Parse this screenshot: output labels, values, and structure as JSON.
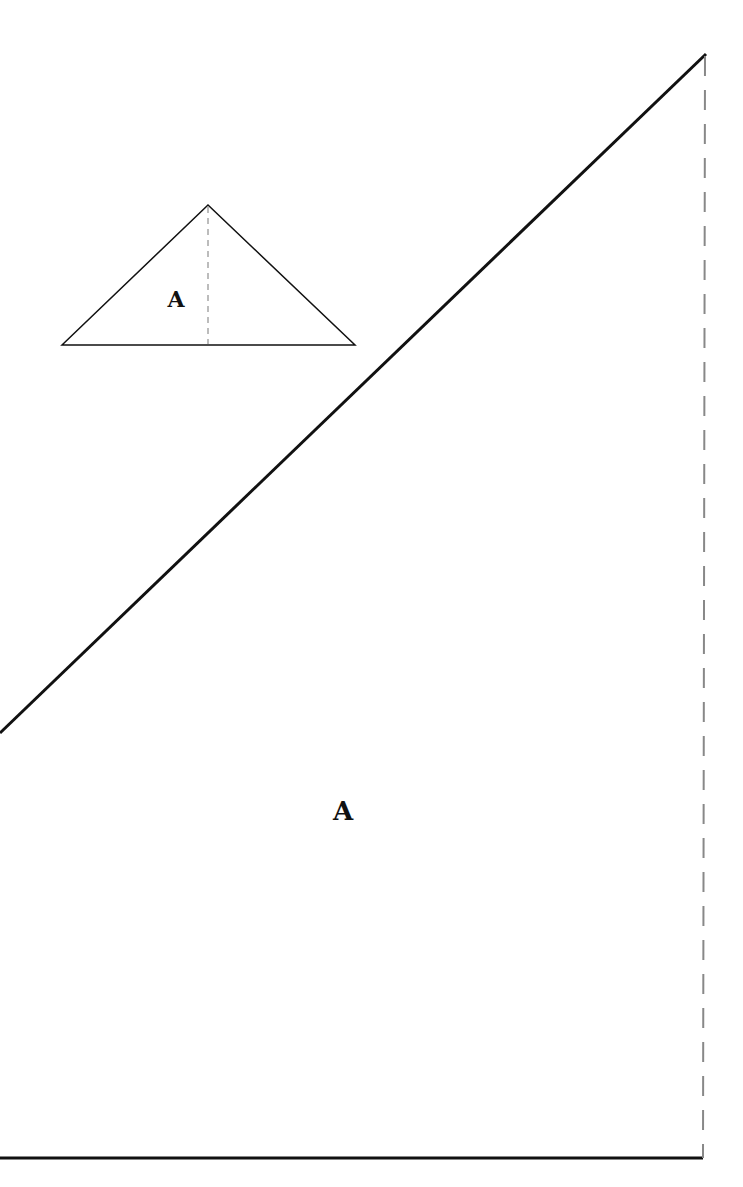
{
  "diagram": {
    "small_triangle": {
      "label": "A",
      "vertices": {
        "left": [
          62,
          345
        ],
        "apex": [
          208,
          205
        ],
        "right": [
          355,
          345
        ]
      },
      "height_line": "dashed"
    },
    "large_triangle": {
      "label": "A",
      "vertices": {
        "top": [
          706,
          54
        ],
        "bottom_right": [
          703,
          1158
        ],
        "left_edge_intersect": [
          0,
          733
        ]
      },
      "vertical_edge": "dashed"
    },
    "colors": {
      "stroke": "#111111",
      "dashed": "#888888",
      "background": "#ffffff"
    }
  }
}
